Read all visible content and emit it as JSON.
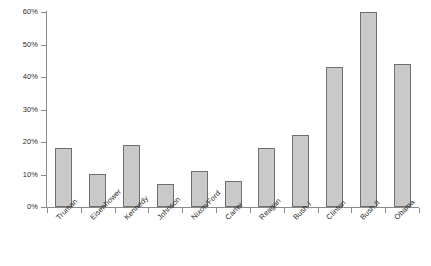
{
  "chart_data": {
    "type": "bar",
    "title": "",
    "xlabel": "",
    "ylabel": "",
    "ylim": [
      0,
      60
    ],
    "grid": false,
    "legend": null,
    "y_tick_labels": [
      "0%",
      "10%",
      "20%",
      "30%",
      "40%",
      "50%",
      "60%"
    ],
    "y_ticks": [
      0,
      10,
      20,
      30,
      40,
      50,
      60
    ],
    "categories": [
      "Truman",
      "Eisenhower",
      "Kennedy",
      "Johnson",
      "Nixon/Ford",
      "Carter",
      "Reagan",
      "Bush I",
      "Clinton",
      "Bush II",
      "Obama"
    ],
    "values": [
      18,
      10,
      19,
      7,
      11,
      8,
      18,
      22,
      43,
      60,
      44
    ],
    "bar_color": "#c9c9c9",
    "bar_edge_color": "#6f6f6f",
    "axis_color": "#8a8a8a",
    "text_color": "#2b2b2b"
  }
}
